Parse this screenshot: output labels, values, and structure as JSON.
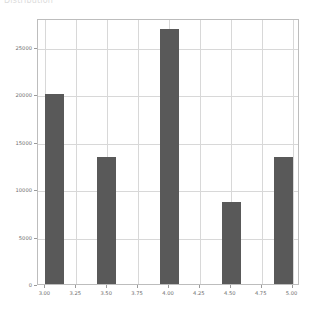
{
  "caption": {
    "text": "Distribution"
  },
  "chart_data": {
    "type": "bar",
    "title": "",
    "xlabel": "",
    "ylabel": "",
    "x": [
      3.075,
      3.495,
      4.005,
      4.505,
      4.925
    ],
    "values": [
      20000,
      13350,
      26800,
      8600,
      13350
    ],
    "bar_width": 0.15,
    "categories": [
      "3.08",
      "3.50",
      "4.00",
      "4.50",
      "4.93"
    ],
    "xlim": [
      2.94,
      5.06
    ],
    "ylim": [
      0,
      28000
    ],
    "xticks": [
      3.0,
      3.25,
      3.5,
      3.75,
      4.0,
      4.25,
      4.5,
      4.75,
      5.0
    ],
    "xticklabels": [
      "3.00",
      "3.25",
      "3.50",
      "3.75",
      "4.00",
      "4.25",
      "4.50",
      "4.75",
      "5.00"
    ],
    "yticks": [
      0,
      5000,
      10000,
      15000,
      20000,
      25000
    ],
    "yticklabels": [
      "0",
      "5000",
      "10000",
      "15000",
      "20000",
      "25000"
    ],
    "grid": true,
    "legend": null,
    "bar_color": "#595959",
    "grid_color": "#d8d8d8",
    "axis_color": "#bdbdbd",
    "tick_label_color": "#6e6e6e"
  }
}
